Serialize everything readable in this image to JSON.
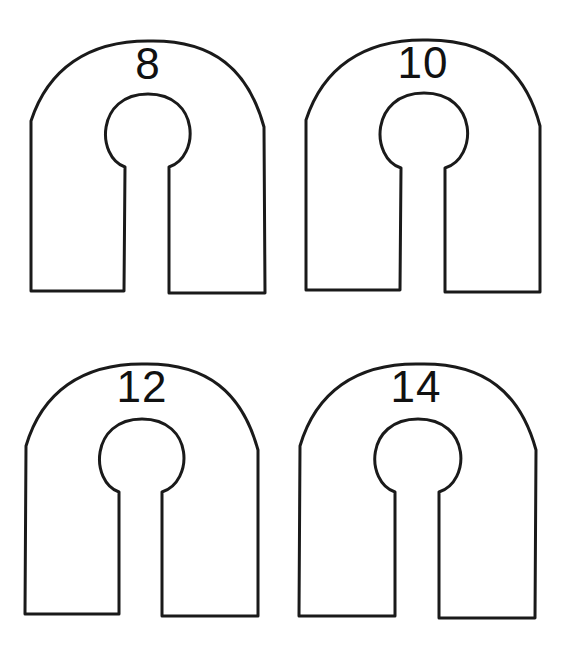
{
  "diagram": {
    "type": "size-dividers",
    "stroke_color": "#1a1a1a",
    "fill_color": "#ffffff",
    "dividers": [
      {
        "label": "8"
      },
      {
        "label": "10"
      },
      {
        "label": "12"
      },
      {
        "label": "14"
      }
    ]
  }
}
